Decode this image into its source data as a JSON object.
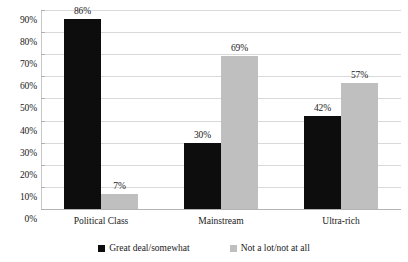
{
  "chart_data": {
    "type": "bar",
    "title": "",
    "subtitle": "",
    "xlabel": "",
    "ylabel": "",
    "categories": [
      "Political Class",
      "Mainstream",
      "Ultra-rich"
    ],
    "series": [
      {
        "name": "Great deal/somewhat",
        "color": "#0d0d0d",
        "values": [
          86,
          30,
          42
        ],
        "labels": [
          "86%",
          "30%",
          "42%"
        ]
      },
      {
        "name": "Not a lot/not at all",
        "color": "#bfbfbf",
        "values": [
          7,
          69,
          57
        ],
        "labels": [
          "7%",
          "69%",
          "57%"
        ]
      }
    ],
    "ylim": [
      0,
      90
    ],
    "ytick_values": [
      0,
      10,
      20,
      30,
      40,
      50,
      60,
      70,
      80,
      90
    ],
    "ytick_labels": [
      "0%",
      "10%",
      "20%",
      "30%",
      "40%",
      "50%",
      "60%",
      "70%",
      "80%",
      "90%"
    ],
    "grid": true,
    "legend_position": "bottom"
  }
}
